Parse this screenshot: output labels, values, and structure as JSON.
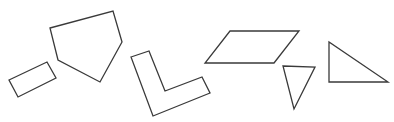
{
  "canvas": {
    "width": 394,
    "height": 122,
    "background": "#ffffff",
    "stroke_color": "#3a3a3a"
  },
  "shapes": [
    {
      "name": "rectangle",
      "points": "9,80 47,62 56,78 18,97"
    },
    {
      "name": "pentagon",
      "points": "50,28 113,11 122,42 100,82 58,60"
    },
    {
      "name": "l-shape",
      "points": "131,57 149,51 165,91 202,77 210,93 153,116"
    },
    {
      "name": "parallelogram",
      "points": "230,31 299,31 274,63 205,63"
    },
    {
      "name": "acute-triangle",
      "points": "283,66 315,67 294,109"
    },
    {
      "name": "right-triangle",
      "points": "329,42 329,82 388,82"
    }
  ]
}
